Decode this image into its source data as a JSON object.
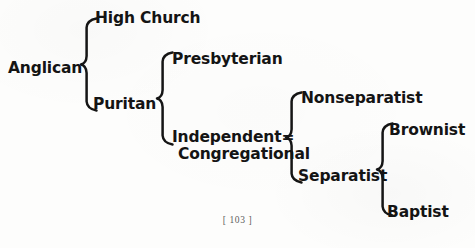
{
  "page": {
    "width": 475,
    "height": 248,
    "background_color": "#fdfdfc",
    "ink_color": "#151515",
    "folio": "[ 103 ]"
  },
  "diagram": {
    "type": "bracket-tree",
    "root": "Anglican",
    "nodes": {
      "anglican": {
        "label": "Anglican",
        "x": 8,
        "y": 60,
        "level": 0
      },
      "high_church": {
        "label": "High Church",
        "x": 95,
        "y": 10,
        "level": 1
      },
      "puritan": {
        "label": "Puritan",
        "x": 93,
        "y": 96,
        "level": 1
      },
      "presbyterian": {
        "label": "Presbyterian",
        "x": 172,
        "y": 51,
        "level": 2
      },
      "independent": {
        "label_line1": "Independent=",
        "label_line2": "Congregational",
        "x": 172,
        "y": 129,
        "level": 2
      },
      "nonseparatist": {
        "label": "Nonseparatist",
        "x": 301,
        "y": 90,
        "level": 3
      },
      "separatist": {
        "label": "Separatist",
        "x": 298,
        "y": 168,
        "level": 3
      },
      "brownist": {
        "label": "Brownist",
        "x": 389,
        "y": 122,
        "level": 4
      },
      "baptist": {
        "label": "Baptist",
        "x": 387,
        "y": 204,
        "level": 4
      }
    },
    "braces": [
      {
        "id": "brace-anglican",
        "parent": "anglican",
        "children": [
          "high_church",
          "puritan"
        ],
        "x": 80,
        "y": 17,
        "width": 19,
        "height": 95
      },
      {
        "id": "brace-puritan",
        "parent": "puritan",
        "children": [
          "presbyterian",
          "independent"
        ],
        "x": 156,
        "y": 51,
        "width": 19,
        "height": 95
      },
      {
        "id": "brace-independent",
        "parent": "independent",
        "children": [
          "nonseparatist",
          "separatist"
        ],
        "x": 285,
        "y": 91,
        "width": 19,
        "height": 93
      },
      {
        "id": "brace-separatist",
        "parent": "separatist",
        "children": [
          "brownist",
          "baptist"
        ],
        "x": 376,
        "y": 122,
        "width": 19,
        "height": 95
      }
    ],
    "edges": [
      {
        "from": "Anglican",
        "to": "High Church"
      },
      {
        "from": "Anglican",
        "to": "Puritan"
      },
      {
        "from": "Puritan",
        "to": "Presbyterian"
      },
      {
        "from": "Puritan",
        "to": "Independent=Congregational"
      },
      {
        "from": "Independent=Congregational",
        "to": "Nonseparatist"
      },
      {
        "from": "Independent=Congregational",
        "to": "Separatist"
      },
      {
        "from": "Separatist",
        "to": "Brownist"
      },
      {
        "from": "Separatist",
        "to": "Baptist"
      }
    ]
  }
}
